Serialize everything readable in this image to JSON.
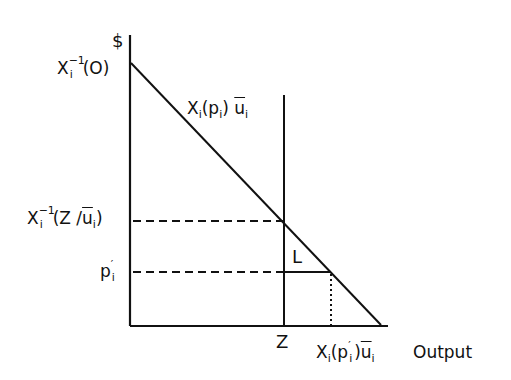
{
  "diagram": {
    "y_axis_label": "$",
    "x_axis_label": "Output",
    "curve_label": {
      "base": "X",
      "sub": "i",
      "arg_open": "(p",
      "arg_sub": "i",
      "arg_close": ")",
      "u": "u",
      "u_sub": "i"
    },
    "y_intercept_label": {
      "base": "X",
      "sup": "−1",
      "sub": "i",
      "arg": "(O)"
    },
    "z_price_label": {
      "base": "X",
      "sup": "−1",
      "sub": "i",
      "arg_open": "(Z /",
      "u": "u",
      "u_sub": "i",
      "arg_close": ")"
    },
    "p_prime_label": {
      "base": "p",
      "prime": "′",
      "sub": "i"
    },
    "region_label": "L",
    "z_label": "Z",
    "x_prime_label": {
      "base": "X",
      "sub": "i",
      "arg_open": "(p",
      "prime": "′",
      "arg_sub": "i",
      "arg_close": ")",
      "u": "u",
      "u_sub": "i"
    },
    "colors": {
      "ink": "#111111",
      "background": "#ffffff"
    },
    "geometry": {
      "y_axis": {
        "x": 130,
        "y1": 35,
        "y2": 326
      },
      "x_axis": {
        "y": 326,
        "x1": 130,
        "x2": 388
      },
      "demand_line": {
        "x1": 131,
        "y1": 63,
        "x2": 381,
        "y2": 325
      },
      "z_line": {
        "x": 284,
        "y1": 95,
        "y2": 326
      },
      "dashed_z_price": {
        "y": 221,
        "x1": 131,
        "x2": 284
      },
      "dashed_p_prime": {
        "y": 272,
        "x1": 131,
        "x2": 284
      },
      "p_prime_segment": {
        "y": 272,
        "x1": 284,
        "x2": 331
      },
      "dotted_x_prime": {
        "x": 331,
        "y1": 272,
        "y2": 326
      }
    }
  }
}
